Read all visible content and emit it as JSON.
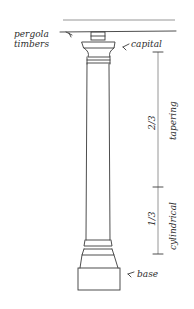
{
  "diagram": {
    "labels": {
      "pergola_line1": "pergola",
      "pergola_line2": "timbers",
      "capital": "capital",
      "base": "base",
      "upper_fraction": "2/3",
      "upper_section": "tapering",
      "lower_fraction": "1/3",
      "lower_section": "cylindrical"
    },
    "proportions": {
      "tapering_fraction": 0.6667,
      "cylindrical_fraction": 0.3333
    },
    "colors": {
      "ink": "#3a3a3a",
      "paper": "#ffffff"
    }
  }
}
